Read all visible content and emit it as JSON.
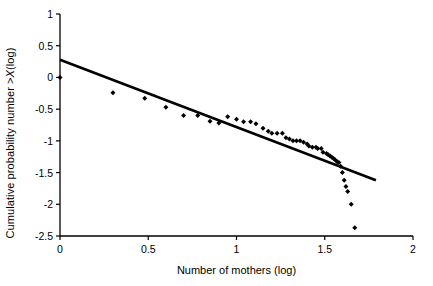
{
  "chart_data": {
    "type": "scatter",
    "title": "",
    "xlabel": "Number of mothers (log)",
    "ylabel": "Cumulative probability number >X (log)",
    "ylabel_parts": {
      "before": "Cumulative probability number >",
      "italic": "X",
      "after": " (log)"
    },
    "xlim": [
      0,
      2
    ],
    "ylim": [
      -2.5,
      1
    ],
    "xticks": [
      0,
      0.5,
      1,
      1.5,
      2
    ],
    "xtick_labels": [
      "0",
      "0.5",
      "1",
      "1.5",
      "2"
    ],
    "yticks": [
      -2.5,
      -2,
      -1.5,
      -1,
      -0.5,
      0,
      0.5,
      1
    ],
    "ytick_labels": [
      "-2.5",
      "-2",
      "-1.5",
      "-1",
      "-0.5",
      "0",
      "0.5",
      "1"
    ],
    "grid": false,
    "legend": false,
    "marker": "diamond",
    "marker_color": "#000000",
    "line_color": "#000000",
    "axis_color": "#000000",
    "series": [
      {
        "name": "Cumulative distribution of number of mothers",
        "type": "scatter",
        "x": [
          0.0,
          0.3,
          0.48,
          0.6,
          0.7,
          0.78,
          0.85,
          0.9,
          0.95,
          1.0,
          1.04,
          1.08,
          1.11,
          1.15,
          1.18,
          1.2,
          1.23,
          1.26,
          1.28,
          1.3,
          1.32,
          1.34,
          1.36,
          1.38,
          1.4,
          1.41,
          1.43,
          1.45,
          1.46,
          1.48,
          1.49,
          1.51,
          1.52,
          1.53,
          1.54,
          1.55,
          1.56,
          1.57,
          1.58,
          1.59,
          1.6,
          1.61,
          1.62,
          1.63,
          1.65,
          1.67
        ],
        "y": [
          0.0,
          -0.24,
          -0.33,
          -0.47,
          -0.6,
          -0.6,
          -0.69,
          -0.72,
          -0.62,
          -0.66,
          -0.7,
          -0.7,
          -0.73,
          -0.8,
          -0.85,
          -0.88,
          -0.88,
          -0.88,
          -0.95,
          -0.97,
          -1.0,
          -1.0,
          -1.0,
          -1.02,
          -1.05,
          -1.08,
          -1.1,
          -1.1,
          -1.12,
          -1.12,
          -1.18,
          -1.2,
          -1.22,
          -1.24,
          -1.26,
          -1.28,
          -1.3,
          -1.33,
          -1.34,
          -1.4,
          -1.5,
          -1.62,
          -1.72,
          -1.8,
          -2.0,
          -2.37
        ]
      }
    ],
    "fit_line": {
      "name": "power-law regression fit",
      "x": [
        0.0,
        1.79
      ],
      "y": [
        0.28,
        -1.62
      ]
    }
  }
}
